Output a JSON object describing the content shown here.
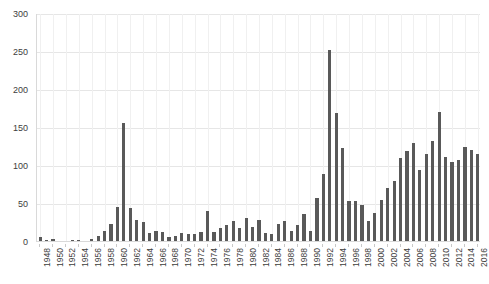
{
  "chart_data": {
    "type": "bar",
    "title": "",
    "subtitle": "",
    "xlabel": "",
    "ylabel": "",
    "ylim": [
      0,
      300
    ],
    "ytick_step": 50,
    "yticks": [
      0,
      50,
      100,
      150,
      200,
      250,
      300
    ],
    "xtick_step": 2,
    "grid": true,
    "grid_axis": "both",
    "legend": false,
    "legend_position": "none",
    "bar_color": "#595959",
    "categories": [
      1948,
      1949,
      1950,
      1951,
      1952,
      1953,
      1954,
      1955,
      1956,
      1957,
      1958,
      1959,
      1960,
      1961,
      1962,
      1963,
      1964,
      1965,
      1966,
      1967,
      1968,
      1969,
      1970,
      1971,
      1972,
      1973,
      1974,
      1975,
      1976,
      1977,
      1978,
      1979,
      1980,
      1981,
      1982,
      1983,
      1984,
      1985,
      1986,
      1987,
      1988,
      1989,
      1990,
      1991,
      1992,
      1993,
      1994,
      1995,
      1996,
      1997,
      1998,
      1999,
      2000,
      2001,
      2002,
      2003,
      2004,
      2005,
      2006,
      2007,
      2008,
      2009,
      2010,
      2011,
      2012,
      2013,
      2014,
      2015,
      2016
    ],
    "values": [
      5,
      1,
      3,
      0,
      0,
      1,
      1,
      0,
      2,
      7,
      13,
      22,
      45,
      155,
      43,
      27,
      25,
      10,
      13,
      12,
      5,
      6,
      10,
      9,
      9,
      12,
      40,
      12,
      17,
      21,
      26,
      17,
      30,
      18,
      28,
      11,
      9,
      22,
      26,
      13,
      21,
      35,
      13,
      57,
      88,
      251,
      168,
      123,
      52,
      53,
      48,
      26,
      37,
      54,
      70,
      79,
      109,
      118,
      129,
      94,
      115,
      131,
      170,
      110,
      104,
      107,
      124,
      120,
      114
    ],
    "xtick_labels": [
      "1948",
      "1950",
      "1952",
      "1954",
      "1956",
      "1958",
      "1960",
      "1962",
      "1964",
      "1966",
      "1968",
      "1970",
      "1972",
      "1974",
      "1976",
      "1978",
      "1980",
      "1982",
      "1984",
      "1986",
      "1988",
      "1990",
      "1992",
      "1994",
      "1996",
      "1998",
      "2000",
      "2002",
      "2004",
      "2006",
      "2008",
      "2010",
      "2012",
      "2014",
      "2016"
    ],
    "ytick_labels": [
      "0",
      "50",
      "100",
      "150",
      "200",
      "250",
      "300"
    ],
    "notable_points": [
      {
        "x": 1961,
        "y": 155,
        "note": "first major spike"
      },
      {
        "x": 1993,
        "y": 251,
        "note": "maximum"
      },
      {
        "x": 2010,
        "y": 170,
        "note": "later peak"
      }
    ]
  }
}
